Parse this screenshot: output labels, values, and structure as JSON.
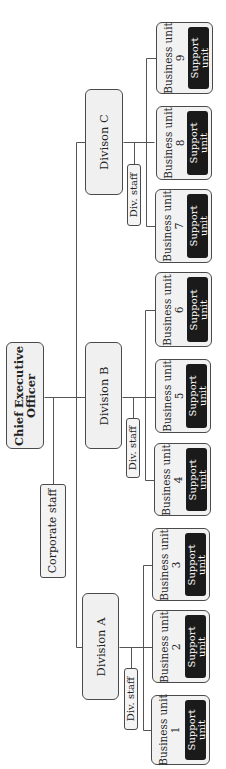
{
  "diagram": {
    "orientation": "rotated-90-ccw",
    "colors": {
      "box_fill": "#f0f0f0",
      "border": "#4a4a4a",
      "support_fill": "#1a1a1a",
      "support_text": "#ffffff",
      "line": "#555555"
    },
    "ceo": {
      "label": "Chief Executive Officer",
      "line1": "Chief Executive",
      "line2": "Officer",
      "x": 6,
      "y": 342,
      "w": 38,
      "h": 107
    },
    "corporate_staff": {
      "label": "Corporate staff",
      "x": 40,
      "y": 484,
      "w": 26,
      "h": 94
    },
    "divisions": [
      {
        "label": "Divison C",
        "x": 85,
        "y": 89,
        "w": 38,
        "h": 106,
        "staff": {
          "label": "Div. staff",
          "x": 127,
          "y": 164,
          "w": 14,
          "h": 62
        }
      },
      {
        "label": "Division B",
        "x": 85,
        "y": 342,
        "w": 37,
        "h": 107,
        "staff": {
          "label": "Div. staff",
          "x": 126,
          "y": 418,
          "w": 14,
          "h": 60
        }
      },
      {
        "label": "Division A",
        "x": 82,
        "y": 593,
        "w": 37,
        "h": 107,
        "staff": {
          "label": "Div. staff",
          "x": 124,
          "y": 668,
          "w": 14,
          "h": 62
        }
      }
    ],
    "business_units": [
      {
        "label": "Business unit",
        "num": "9",
        "support": [
          "Support",
          "unit"
        ],
        "x": 156,
        "y": 22,
        "w": 57,
        "h": 72
      },
      {
        "label": "Business unit",
        "num": "8",
        "support": [
          "Support",
          "unit"
        ],
        "x": 156,
        "y": 106,
        "w": 56,
        "h": 74
      },
      {
        "label": "Business unit",
        "num": "7",
        "support": [
          "Support",
          "unit"
        ],
        "x": 155,
        "y": 189,
        "w": 57,
        "h": 74
      },
      {
        "label": "Business unit",
        "num": "6",
        "support": [
          "Support",
          "unit"
        ],
        "x": 155,
        "y": 272,
        "w": 57,
        "h": 75
      },
      {
        "label": "Business unit",
        "num": "5",
        "support": [
          "Support",
          "unit"
        ],
        "x": 155,
        "y": 359,
        "w": 56,
        "h": 74
      },
      {
        "label": "Business unit",
        "num": "4",
        "support": [
          "Support",
          "unit"
        ],
        "x": 154,
        "y": 443,
        "w": 57,
        "h": 73
      },
      {
        "label": "Business unit",
        "num": "3",
        "support": [
          "Support",
          "unit"
        ],
        "x": 152,
        "y": 528,
        "w": 58,
        "h": 73
      },
      {
        "label": "Business unit",
        "num": "2",
        "support": [
          "Support",
          "unit"
        ],
        "x": 152,
        "y": 610,
        "w": 58,
        "h": 73
      },
      {
        "label": "Business unit",
        "num": "1",
        "support": [
          "Support",
          "unit"
        ],
        "x": 151,
        "y": 695,
        "w": 59,
        "h": 70
      }
    ],
    "lines": [
      [
        44,
        397,
        85,
        397
      ],
      [
        76,
        142,
        76,
        647
      ],
      [
        76,
        142,
        85,
        142
      ],
      [
        76,
        647,
        82,
        647
      ],
      [
        53,
        397,
        53,
        484
      ],
      [
        123,
        142,
        154,
        142
      ],
      [
        134,
        142,
        134,
        164
      ],
      [
        146,
        58,
        146,
        226
      ],
      [
        146,
        58,
        156,
        58
      ],
      [
        146,
        226,
        155,
        226
      ],
      [
        122,
        397,
        155,
        397
      ],
      [
        133,
        397,
        133,
        418
      ],
      [
        145,
        310,
        145,
        480
      ],
      [
        145,
        310,
        155,
        310
      ],
      [
        145,
        480,
        154,
        480
      ],
      [
        119,
        647,
        152,
        647
      ],
      [
        131,
        647,
        131,
        668
      ],
      [
        143,
        565,
        143,
        730
      ],
      [
        143,
        565,
        152,
        565
      ],
      [
        143,
        730,
        151,
        730
      ]
    ]
  }
}
